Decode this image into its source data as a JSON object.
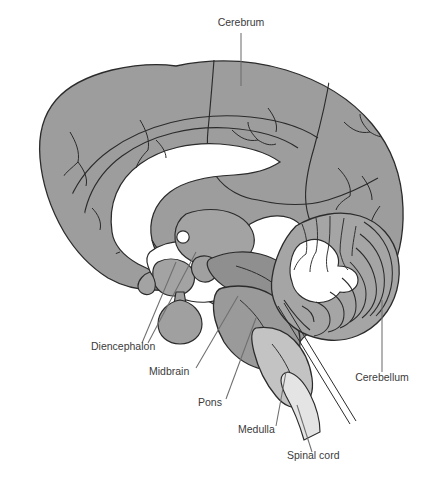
{
  "figure": {
    "kind": "anatomical-illustration",
    "width": 436,
    "height": 478,
    "background": "#ffffff",
    "line_color": "#2b2b2b",
    "leader_color": "#6e6e6e",
    "text_color": "#3b3b3b",
    "font_size_px": 10.5
  },
  "palette": {
    "cerebrum_fill": "#9d9d9d",
    "cerebrum_inner_fill": "#a7a7a7",
    "white_matter_fill": "#ffffff",
    "diencephalon_fill": "#a3a3a3",
    "pituitary_fill": "#a0a0a0",
    "midbrain_fill": "#8f8f8f",
    "pons_fill": "#9a9a9a",
    "medulla_fill": "#c3c3c3",
    "spinal_cord_fill": "#e4e4e4",
    "cerebellum_fill": "#a5a5a5",
    "cerebellum_core_fill": "#ffffff"
  },
  "labels": [
    {
      "id": "cerebrum",
      "text": "Cerebrum",
      "text_x": 241,
      "text_y": 26,
      "anchor": "middle",
      "leaders": [
        [
          241,
          33,
          241,
          86
        ]
      ]
    },
    {
      "id": "diencephalon",
      "text": "Diencephalon",
      "text_x": 91,
      "text_y": 350,
      "anchor": "start",
      "leaders": [
        [
          142,
          343,
          176,
          262
        ],
        [
          148,
          343,
          196,
          252
        ]
      ]
    },
    {
      "id": "midbrain",
      "text": "Midbrain",
      "text_x": 149,
      "text_y": 375,
      "anchor": "start",
      "leaders": [
        [
          196,
          368,
          238,
          296
        ]
      ]
    },
    {
      "id": "pons",
      "text": "Pons",
      "text_x": 198,
      "text_y": 406,
      "anchor": "start",
      "leaders": [
        [
          226,
          399,
          256,
          318
        ]
      ]
    },
    {
      "id": "medulla",
      "text": "Medulla",
      "text_x": 238,
      "text_y": 433,
      "anchor": "start",
      "leaders": [
        [
          276,
          426,
          286,
          372
        ]
      ]
    },
    {
      "id": "spinal-cord",
      "text": "Spinal cord",
      "text_x": 287,
      "text_y": 459,
      "anchor": "start",
      "leaders": [
        [
          312,
          452,
          297,
          405
        ]
      ]
    },
    {
      "id": "cerebellum",
      "text": "Cerebellum",
      "text_x": 382,
      "text_y": 381,
      "anchor": "middle",
      "leaders": [
        [
          382,
          372,
          382,
          300
        ]
      ]
    }
  ],
  "structures": [
    {
      "id": "cerebrum",
      "label": "Cerebrum",
      "region": "telencephalon"
    },
    {
      "id": "diencephalon",
      "label": "Diencephalon",
      "region": "thalamus-hypothalamus"
    },
    {
      "id": "midbrain",
      "label": "Midbrain",
      "region": "mesencephalon"
    },
    {
      "id": "pons",
      "label": "Pons",
      "region": "metencephalon"
    },
    {
      "id": "medulla",
      "label": "Medulla",
      "region": "myelencephalon"
    },
    {
      "id": "spinal-cord",
      "label": "Spinal cord",
      "region": "spinal"
    },
    {
      "id": "cerebellum",
      "label": "Cerebellum",
      "region": "metencephalon"
    }
  ]
}
